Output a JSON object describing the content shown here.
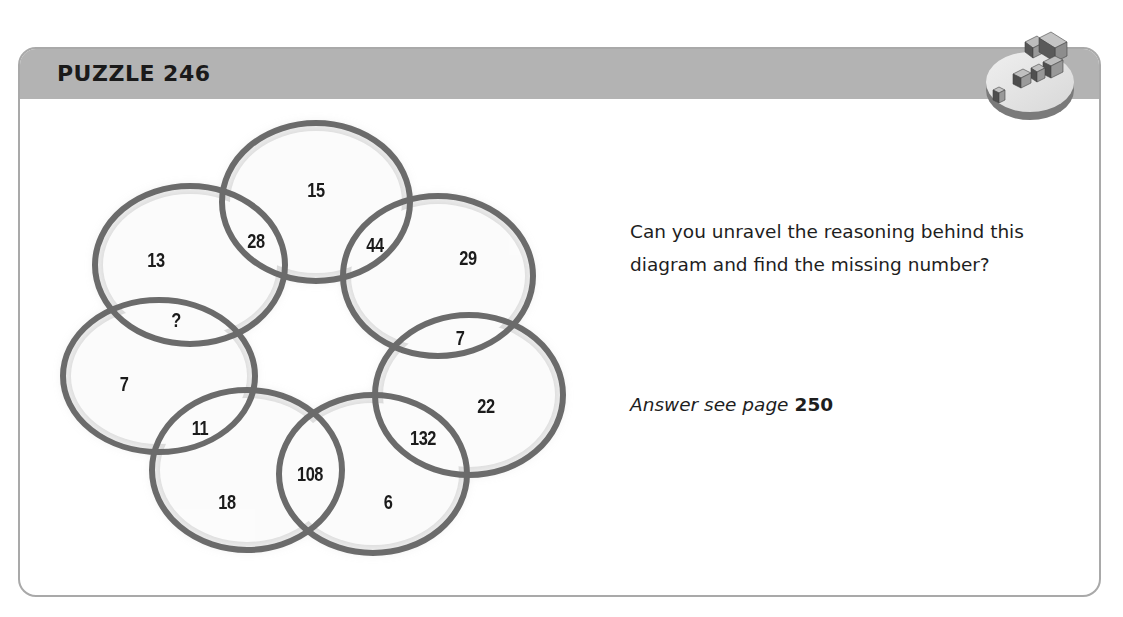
{
  "header": {
    "title": "PUZZLE 246",
    "badge_icon": "question-mark-icon"
  },
  "puzzle": {
    "question": "Can you unravel the reasoning behind this diagram and find the missing number?",
    "answer_prefix": "Answer see page",
    "answer_page": "250"
  },
  "diagram": {
    "ellipse_stroke": "#6b6b6b",
    "ellipses": [
      {
        "id": "top",
        "cx": 316,
        "cy": 202,
        "rx": 97,
        "ry": 82
      },
      {
        "id": "upper-left",
        "cx": 190,
        "cy": 265,
        "rx": 98,
        "ry": 82
      },
      {
        "id": "upper-right",
        "cx": 438,
        "cy": 276,
        "rx": 98,
        "ry": 83
      },
      {
        "id": "left",
        "cx": 159,
        "cy": 376,
        "rx": 99,
        "ry": 79
      },
      {
        "id": "right",
        "cx": 469,
        "cy": 395,
        "rx": 97,
        "ry": 83
      },
      {
        "id": "bottom-left",
        "cx": 247,
        "cy": 470,
        "rx": 98,
        "ry": 83
      },
      {
        "id": "bottom-right",
        "cx": 373,
        "cy": 474,
        "rx": 97,
        "ry": 82
      }
    ],
    "values": {
      "top": "15",
      "top_upper_left_overlap": "28",
      "top_upper_right_overlap": "44",
      "upper_left": "13",
      "upper_right": "29",
      "upper_left_left_overlap": "?",
      "upper_right_right_overlap": "7",
      "left": "7",
      "right": "22",
      "left_bottom_left_overlap": "11",
      "right_bottom_right_overlap": "132",
      "bottom_left": "18",
      "bottom_left_bottom_right_overlap": "108",
      "bottom_right": "6"
    }
  }
}
